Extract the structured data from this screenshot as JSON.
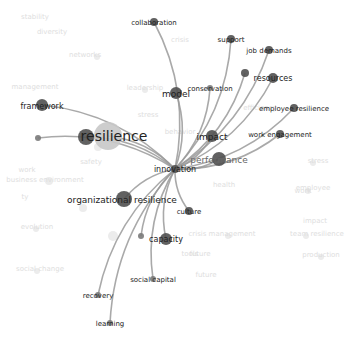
{
  "diagram": {
    "type": "co-occurrence network (focused on one term)",
    "focus_term": "innovation",
    "center": {
      "x": 175,
      "y": 169
    },
    "colors": {
      "edge": "#9a9a9a",
      "node_dark": "#505050",
      "node_mid": "#7a7a7a",
      "node_big_light": "#c8c8c8",
      "label_active": "#222222",
      "label_faded": "#dedede",
      "node_faded": "#ececec"
    },
    "active_nodes": [
      {
        "id": "innovation",
        "label": "innovation",
        "x": 175,
        "y": 169,
        "r": 4,
        "fs": 8,
        "lx": 175,
        "ly": 172
      },
      {
        "id": "collaboration",
        "label": "collaboration",
        "x": 154,
        "y": 22,
        "r": 4,
        "fs": 7,
        "lx": 154,
        "ly": 25
      },
      {
        "id": "support",
        "label": "support",
        "x": 231,
        "y": 39,
        "r": 4,
        "fs": 7,
        "lx": 231,
        "ly": 42
      },
      {
        "id": "job-demands",
        "label": "job demands",
        "x": 269,
        "y": 50,
        "r": 4,
        "fs": 7,
        "lx": 269,
        "ly": 53
      },
      {
        "id": "resources-small",
        "label": "",
        "x": 245,
        "y": 73,
        "r": 4,
        "fs": 7,
        "lx": 245,
        "ly": 73
      },
      {
        "id": "resources",
        "label": "resources",
        "x": 273,
        "y": 78,
        "r": 5,
        "fs": 8,
        "lx": 273,
        "ly": 81
      },
      {
        "id": "conservation",
        "label": "conservation",
        "x": 210,
        "y": 88,
        "r": 3,
        "fs": 7,
        "lx": 210,
        "ly": 91
      },
      {
        "id": "model",
        "label": "model",
        "x": 176,
        "y": 93,
        "r": 6,
        "fs": 9,
        "lx": 176,
        "ly": 97
      },
      {
        "id": "employee-resilience",
        "label": "employee resilience",
        "x": 294,
        "y": 108,
        "r": 4,
        "fs": 7,
        "lx": 294,
        "ly": 111
      },
      {
        "id": "framework",
        "label": "framework",
        "x": 42,
        "y": 105,
        "r": 6,
        "fs": 8,
        "lx": 42,
        "ly": 109
      },
      {
        "id": "resilience-dark",
        "label": "",
        "x": 86,
        "y": 137,
        "r": 8,
        "fs": 8,
        "lx": 86,
        "ly": 137
      },
      {
        "id": "resilience",
        "label": "resilience",
        "x": 108,
        "y": 136,
        "r": 14,
        "fs": 14,
        "lx": 114,
        "ly": 141
      },
      {
        "id": "impact",
        "label": "impact",
        "x": 212,
        "y": 136,
        "r": 6,
        "fs": 9,
        "lx": 212,
        "ly": 140
      },
      {
        "id": "work-engagement",
        "label": "work engagement",
        "x": 280,
        "y": 134,
        "r": 4,
        "fs": 7,
        "lx": 280,
        "ly": 137
      },
      {
        "id": "left-small",
        "label": "",
        "x": 38,
        "y": 138,
        "r": 3,
        "fs": 7,
        "lx": 38,
        "ly": 138
      },
      {
        "id": "performance",
        "label": "performance",
        "x": 219,
        "y": 159,
        "r": 7,
        "fs": 9,
        "lx": 219,
        "ly": 163
      },
      {
        "id": "organizational-resilience",
        "label": "organizational resilience",
        "x": 124,
        "y": 199,
        "r": 8,
        "fs": 9,
        "lx": 122,
        "ly": 203
      },
      {
        "id": "culture",
        "label": "culture",
        "x": 189,
        "y": 211,
        "r": 4,
        "fs": 7,
        "lx": 189,
        "ly": 214
      },
      {
        "id": "capacity-small",
        "label": "",
        "x": 141,
        "y": 236,
        "r": 3,
        "fs": 7,
        "lx": 141,
        "ly": 236
      },
      {
        "id": "capacity",
        "label": "capacity",
        "x": 166,
        "y": 239,
        "r": 6,
        "fs": 8,
        "lx": 166,
        "ly": 242
      },
      {
        "id": "social-capital",
        "label": "social capital",
        "x": 153,
        "y": 279,
        "r": 3,
        "fs": 7,
        "lx": 153,
        "ly": 282
      },
      {
        "id": "recovery",
        "label": "recovery",
        "x": 98,
        "y": 295,
        "r": 3,
        "fs": 7,
        "lx": 98,
        "ly": 298
      },
      {
        "id": "learning",
        "label": "learning",
        "x": 110,
        "y": 323,
        "r": 3,
        "fs": 7,
        "lx": 110,
        "ly": 326
      }
    ],
    "faded_labels": [
      {
        "label": "stability",
        "x": 35,
        "y": 19
      },
      {
        "label": "diversity",
        "x": 52,
        "y": 34
      },
      {
        "label": "crisis",
        "x": 180,
        "y": 42
      },
      {
        "label": "networks",
        "x": 85,
        "y": 57
      },
      {
        "label": "management",
        "x": 35,
        "y": 89
      },
      {
        "label": "leadership",
        "x": 145,
        "y": 90
      },
      {
        "label": "efficiency",
        "x": 260,
        "y": 110
      },
      {
        "label": "stress",
        "x": 148,
        "y": 117
      },
      {
        "label": "behavior",
        "x": 180,
        "y": 134
      },
      {
        "label": "safety",
        "x": 91,
        "y": 164
      },
      {
        "label": "work",
        "x": 27,
        "y": 172
      },
      {
        "label": "business environment",
        "x": 45,
        "y": 182
      },
      {
        "label": "stress",
        "x": 318,
        "y": 163
      },
      {
        "label": "health",
        "x": 224,
        "y": 187
      },
      {
        "label": "work",
        "x": 303,
        "y": 193
      },
      {
        "label": "employee",
        "x": 313,
        "y": 190
      },
      {
        "label": "ty",
        "x": 25,
        "y": 199
      },
      {
        "label": "evolution",
        "x": 37,
        "y": 229
      },
      {
        "label": "crisis management",
        "x": 222,
        "y": 236
      },
      {
        "label": "team resilience",
        "x": 317,
        "y": 236
      },
      {
        "label": "impact",
        "x": 315,
        "y": 223
      },
      {
        "label": "future",
        "x": 200,
        "y": 256
      },
      {
        "label": "tools",
        "x": 190,
        "y": 256
      },
      {
        "label": "production",
        "x": 321,
        "y": 257
      },
      {
        "label": "social change",
        "x": 40,
        "y": 271
      },
      {
        "label": "future",
        "x": 206,
        "y": 277
      }
    ],
    "faded_nodes": [
      {
        "x": 97,
        "y": 57,
        "r": 3
      },
      {
        "x": 98,
        "y": 147,
        "r": 4
      },
      {
        "x": 49,
        "y": 181,
        "r": 4
      },
      {
        "x": 83,
        "y": 208,
        "r": 4
      },
      {
        "x": 36,
        "y": 229,
        "r": 3
      },
      {
        "x": 113,
        "y": 236,
        "r": 5
      },
      {
        "x": 37,
        "y": 271,
        "r": 3
      },
      {
        "x": 313,
        "y": 163,
        "r": 3
      },
      {
        "x": 308,
        "y": 191,
        "r": 3
      },
      {
        "x": 306,
        "y": 236,
        "r": 3
      },
      {
        "x": 321,
        "y": 257,
        "r": 3
      },
      {
        "x": 228,
        "y": 236,
        "r": 3
      },
      {
        "x": 145,
        "y": 90,
        "r": 3
      }
    ]
  }
}
